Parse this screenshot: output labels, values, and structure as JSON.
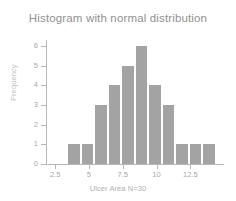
{
  "chart_data": {
    "type": "bar",
    "title": "Histogram with normal distribution",
    "xlabel": "Ulcer Area N=30",
    "ylabel": "Frequency",
    "grid": false,
    "legend": null,
    "xlim": [
      1.9,
      14.4
    ],
    "ylim": [
      0,
      6.3
    ],
    "xticks": [
      2.5,
      5,
      7.5,
      10,
      12.5
    ],
    "xtick_labels": [
      "2.5",
      "5",
      "7.5",
      "10",
      "12.5"
    ],
    "yticks": [
      0,
      1,
      2,
      3,
      4,
      5,
      6
    ],
    "ytick_labels": [
      "0",
      "1",
      "2",
      "3",
      "4",
      "5",
      "6"
    ],
    "bin_width": 1,
    "bin_edges": [
      3.4,
      4.4,
      5.4,
      6.4,
      7.4,
      8.4,
      9.4,
      10.4,
      11.4,
      12.4,
      13.4,
      14.4
    ],
    "bin_centers": [
      3.9,
      4.9,
      5.9,
      6.9,
      7.9,
      8.9,
      9.9,
      10.9,
      11.9,
      12.9,
      13.9
    ],
    "categories": [
      "3.9",
      "4.9",
      "5.9",
      "6.9",
      "7.9",
      "8.9",
      "9.9",
      "10.9",
      "11.9",
      "12.9",
      "13.9"
    ],
    "values": [
      1,
      1,
      3,
      4,
      5,
      6,
      4,
      3,
      1,
      1,
      1
    ],
    "total_count": 30,
    "bar_color": "#a3a3a3",
    "axis_color": "#b7b7b7",
    "title_color": "#919191",
    "tick_label_color": "#a8a8a8",
    "axis_title_color": "#b0b0b0",
    "background_color": "#ffffff"
  }
}
